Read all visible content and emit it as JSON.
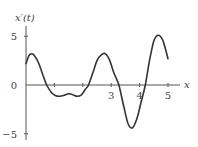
{
  "chart_data": {
    "type": "line",
    "title": "",
    "xlabel": "x",
    "ylabel": "x′(t)",
    "xlim": [
      0,
      5.4
    ],
    "ylim": [
      -5.5,
      5.8
    ],
    "grid": false,
    "legend": null,
    "x_ticks": [
      1,
      2,
      3,
      4,
      5
    ],
    "x_tick_labels": [
      "",
      "",
      "3",
      "4",
      "5"
    ],
    "y_ticks": [
      5,
      0,
      -5
    ],
    "y_tick_labels": [
      "5",
      "0",
      "−5"
    ],
    "series": [
      {
        "name": "x′(t)",
        "color": "#333333",
        "x": [
          0,
          0.1,
          0.2,
          0.3,
          0.45,
          0.6,
          0.73,
          0.9,
          1.05,
          1.2,
          1.35,
          1.5,
          1.65,
          1.8,
          1.95,
          2.1,
          2.2,
          2.35,
          2.5,
          2.65,
          2.8,
          2.95,
          3.1,
          3.27,
          3.45,
          3.6,
          3.75,
          3.9,
          4.05,
          4.2,
          4.35,
          4.5,
          4.65,
          4.8,
          4.9,
          5.0
        ],
        "values": [
          2.2,
          3.0,
          3.2,
          3.0,
          2.2,
          1.0,
          0.0,
          -0.8,
          -1.1,
          -1.15,
          -1.05,
          -0.9,
          -1.0,
          -1.15,
          -1.0,
          -0.4,
          0.0,
          1.2,
          2.5,
          3.1,
          3.2,
          2.5,
          1.2,
          0.0,
          -2.3,
          -4.0,
          -4.4,
          -3.5,
          -1.8,
          0.0,
          2.5,
          4.5,
          5.1,
          4.7,
          3.8,
          2.7
        ]
      }
    ]
  }
}
